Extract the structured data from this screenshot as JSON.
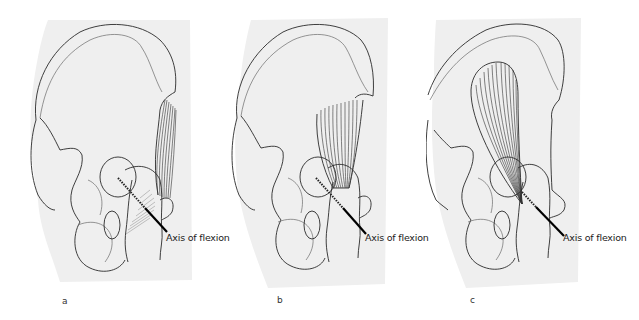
{
  "figure": {
    "panels": [
      {
        "letter": "a",
        "axis_label": "Axis of flexion",
        "muscle": "lateral-fan-crossing-axis"
      },
      {
        "letter": "b",
        "axis_label": "Axis of flexion",
        "muscle": "anterior-fan-above-axis"
      },
      {
        "letter": "c",
        "axis_label": "Axis of flexion",
        "muscle": "teardrop-fan-converging-at-axis"
      }
    ],
    "colors": {
      "background_silhouette": "#efefef",
      "line": "#2a2a2a",
      "axis_line": "#000000"
    }
  }
}
